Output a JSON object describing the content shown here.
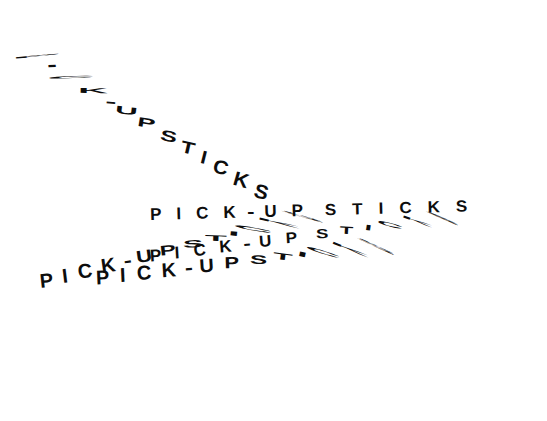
{
  "artwork": {
    "title": "Pick-Up Sticks",
    "phrase": "PICK-UP STICKS",
    "background_color": "#ffffff",
    "ink_color": "#0d0d0d",
    "description": "Typographic composition: the phrase PICK-UP STICKS repeated five times on radiating diagonals, with individual letters progressively stretched and flattened until they read as scattered sticks.",
    "repetitions": 5
  },
  "lines": [
    {
      "id": "line-a",
      "name": "descending-diagonal-line",
      "text": "PICK-UP STICKS",
      "direction": "top-left to bottom-right",
      "rotation_deg": 31,
      "glyphs": [
        {
          "ch": "P",
          "scale_x": 3.6,
          "scale_y": 0.1,
          "rot": -36,
          "gap": 9
        },
        {
          "ch": "I",
          "scale_x": 2.4,
          "scale_y": 0.16,
          "rot": -34,
          "gap": 11
        },
        {
          "ch": "C",
          "scale_x": 3.2,
          "scale_y": 0.14,
          "rot": -33,
          "gap": 11
        },
        {
          "ch": "K",
          "scale_x": 2.0,
          "scale_y": 0.34,
          "rot": -30,
          "gap": 10
        },
        {
          "ch": "-",
          "scale_x": 1.6,
          "scale_y": 0.7,
          "rot": -26,
          "gap": 7
        },
        {
          "ch": "U",
          "scale_x": 1.5,
          "scale_y": 0.5,
          "rot": -24,
          "gap": 9
        },
        {
          "ch": "P",
          "scale_x": 1.3,
          "scale_y": 0.62,
          "rot": -22,
          "gap": 12
        },
        {
          "ch": "S",
          "scale_x": 1.2,
          "scale_y": 0.72,
          "rot": -20,
          "gap": 9
        },
        {
          "ch": "T",
          "scale_x": 1.1,
          "scale_y": 0.8,
          "rot": -18,
          "gap": 9
        },
        {
          "ch": "I",
          "scale_x": 1.0,
          "scale_y": 0.88,
          "rot": -17,
          "gap": 9
        },
        {
          "ch": "C",
          "scale_x": 1.0,
          "scale_y": 0.92,
          "rot": -16,
          "gap": 9
        },
        {
          "ch": "K",
          "scale_x": 1.0,
          "scale_y": 0.95,
          "rot": -15,
          "gap": 9
        },
        {
          "ch": "S",
          "scale_x": 1.0,
          "scale_y": 0.95,
          "rot": -15,
          "gap": 9
        }
      ]
    },
    {
      "id": "line-b",
      "name": "lower-left-rising-line",
      "text": "PICK-UP STICKS",
      "direction": "lower-left rising to the right",
      "rotation_deg": -14,
      "glyphs": [
        {
          "ch": "P",
          "scale_x": 1.0,
          "scale_y": 1.0,
          "rot": 8,
          "gap": 10
        },
        {
          "ch": "I",
          "scale_x": 1.0,
          "scale_y": 1.0,
          "rot": 7,
          "gap": 10
        },
        {
          "ch": "C",
          "scale_x": 1.0,
          "scale_y": 1.0,
          "rot": 6,
          "gap": 10
        },
        {
          "ch": "K",
          "scale_x": 1.0,
          "scale_y": 1.0,
          "rot": 6,
          "gap": 9
        },
        {
          "ch": "-",
          "scale_x": 1.2,
          "scale_y": 0.9,
          "rot": 6,
          "gap": 7
        },
        {
          "ch": "U",
          "scale_x": 1.1,
          "scale_y": 0.85,
          "rot": 6,
          "gap": 10
        },
        {
          "ch": "P",
          "scale_x": 1.2,
          "scale_y": 0.7,
          "rot": 8,
          "gap": 13
        },
        {
          "ch": "S",
          "scale_x": 1.5,
          "scale_y": 0.52,
          "rot": 12,
          "gap": 10
        },
        {
          "ch": "T",
          "scale_x": 1.8,
          "scale_y": 0.4,
          "rot": 16,
          "gap": 10
        },
        {
          "ch": "I",
          "scale_x": 2.2,
          "scale_y": 0.3,
          "rot": 20,
          "gap": 10
        },
        {
          "ch": "C",
          "scale_x": 2.8,
          "scale_y": 0.2,
          "rot": 24,
          "gap": 11
        },
        {
          "ch": "K",
          "scale_x": 3.2,
          "scale_y": 0.14,
          "rot": 27,
          "gap": 12
        },
        {
          "ch": "S",
          "scale_x": 3.6,
          "scale_y": 0.1,
          "rot": 30,
          "gap": 12
        }
      ]
    },
    {
      "id": "line-c",
      "name": "lower-left-shallow-line",
      "text": "PICK-UP STICKS",
      "direction": "lower-left, shallow rise",
      "rotation_deg": -6.5,
      "glyphs": [
        {
          "ch": "P",
          "scale_x": 1.0,
          "scale_y": 1.0,
          "rot": 4,
          "gap": 11
        },
        {
          "ch": "I",
          "scale_x": 1.0,
          "scale_y": 1.0,
          "rot": 4,
          "gap": 11
        },
        {
          "ch": "C",
          "scale_x": 1.0,
          "scale_y": 1.0,
          "rot": 3,
          "gap": 11
        },
        {
          "ch": "K",
          "scale_x": 1.0,
          "scale_y": 1.0,
          "rot": 3,
          "gap": 9
        },
        {
          "ch": "-",
          "scale_x": 1.2,
          "scale_y": 0.95,
          "rot": 3,
          "gap": 8
        },
        {
          "ch": "U",
          "scale_x": 1.0,
          "scale_y": 0.95,
          "rot": 3,
          "gap": 11
        },
        {
          "ch": "P",
          "scale_x": 1.1,
          "scale_y": 0.8,
          "rot": 5,
          "gap": 14
        },
        {
          "ch": "S",
          "scale_x": 1.3,
          "scale_y": 0.62,
          "rot": 9,
          "gap": 11
        },
        {
          "ch": "T",
          "scale_x": 1.6,
          "scale_y": 0.46,
          "rot": 14,
          "gap": 11
        },
        {
          "ch": "I",
          "scale_x": 2.0,
          "scale_y": 0.34,
          "rot": 19,
          "gap": 11
        },
        {
          "ch": "C",
          "scale_x": 2.6,
          "scale_y": 0.22,
          "rot": 24,
          "gap": 12
        },
        {
          "ch": "K",
          "scale_x": 3.0,
          "scale_y": 0.15,
          "rot": 28,
          "gap": 13
        },
        {
          "ch": "S",
          "scale_x": 3.4,
          "scale_y": 0.11,
          "rot": 31,
          "gap": 13
        }
      ]
    },
    {
      "id": "line-d",
      "name": "central-horizontal-line",
      "text": "PICK-UP STICKS",
      "direction": "near-horizontal through the centre",
      "rotation_deg": -1.5,
      "glyphs": [
        {
          "ch": "P",
          "scale_x": 1.0,
          "scale_y": 1.0,
          "rot": 0,
          "gap": 15
        },
        {
          "ch": "I",
          "scale_x": 1.0,
          "scale_y": 1.0,
          "rot": 0,
          "gap": 15
        },
        {
          "ch": "C",
          "scale_x": 1.0,
          "scale_y": 1.0,
          "rot": 0,
          "gap": 15
        },
        {
          "ch": "K",
          "scale_x": 1.0,
          "scale_y": 1.0,
          "rot": 0,
          "gap": 12
        },
        {
          "ch": "-",
          "scale_x": 1.3,
          "scale_y": 1.0,
          "rot": 0,
          "gap": 11
        },
        {
          "ch": "U",
          "scale_x": 1.0,
          "scale_y": 1.0,
          "rot": 0,
          "gap": 15
        },
        {
          "ch": "P",
          "scale_x": 1.0,
          "scale_y": 1.0,
          "rot": 0,
          "gap": 22
        },
        {
          "ch": "S",
          "scale_x": 1.0,
          "scale_y": 0.95,
          "rot": 0,
          "gap": 16
        },
        {
          "ch": "T",
          "scale_x": 1.0,
          "scale_y": 0.95,
          "rot": 0,
          "gap": 16
        },
        {
          "ch": "I",
          "scale_x": 1.0,
          "scale_y": 0.95,
          "rot": 0,
          "gap": 16
        },
        {
          "ch": "C",
          "scale_x": 1.0,
          "scale_y": 0.95,
          "rot": 0,
          "gap": 16
        },
        {
          "ch": "K",
          "scale_x": 1.0,
          "scale_y": 0.95,
          "rot": 0,
          "gap": 16
        },
        {
          "ch": "S",
          "scale_x": 1.0,
          "scale_y": 0.95,
          "rot": 0,
          "gap": 16
        }
      ]
    },
    {
      "id": "line-e",
      "name": "lower-horizontal-line",
      "text": "PICK-UP STICKS",
      "direction": "lower band, slight rise then stretch",
      "rotation_deg": -7.5,
      "glyphs": [
        {
          "ch": "P",
          "scale_x": 1.0,
          "scale_y": 1.0,
          "rot": 4,
          "gap": 14
        },
        {
          "ch": "I",
          "scale_x": 1.0,
          "scale_y": 1.0,
          "rot": 4,
          "gap": 14
        },
        {
          "ch": "C",
          "scale_x": 1.0,
          "scale_y": 1.0,
          "rot": 3,
          "gap": 14
        },
        {
          "ch": "K",
          "scale_x": 1.0,
          "scale_y": 1.0,
          "rot": 3,
          "gap": 12
        },
        {
          "ch": "-",
          "scale_x": 1.3,
          "scale_y": 0.95,
          "rot": 3,
          "gap": 10
        },
        {
          "ch": "U",
          "scale_x": 1.0,
          "scale_y": 0.95,
          "rot": 3,
          "gap": 14
        },
        {
          "ch": "P",
          "scale_x": 1.0,
          "scale_y": 0.9,
          "rot": 4,
          "gap": 20
        },
        {
          "ch": "S",
          "scale_x": 1.1,
          "scale_y": 0.78,
          "rot": 7,
          "gap": 14
        },
        {
          "ch": "T",
          "scale_x": 1.3,
          "scale_y": 0.62,
          "rot": 11,
          "gap": 14
        },
        {
          "ch": "I",
          "scale_x": 1.6,
          "scale_y": 0.46,
          "rot": 16,
          "gap": 14
        },
        {
          "ch": "C",
          "scale_x": 2.2,
          "scale_y": 0.3,
          "rot": 22,
          "gap": 14
        },
        {
          "ch": "K",
          "scale_x": 2.8,
          "scale_y": 0.18,
          "rot": 27,
          "gap": 14
        },
        {
          "ch": "S",
          "scale_x": 3.4,
          "scale_y": 0.11,
          "rot": 31,
          "gap": 14
        }
      ]
    }
  ]
}
